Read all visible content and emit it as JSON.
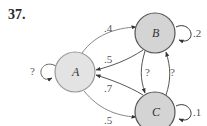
{
  "problem": {
    "number": "37."
  },
  "nodes": [
    {
      "id": "A",
      "label": "A",
      "cx": 75,
      "cy": 72,
      "r": 20,
      "fill": "#e3e3e3",
      "stroke": "#999999"
    },
    {
      "id": "B",
      "label": "B",
      "cx": 155,
      "cy": 33,
      "r": 20,
      "fill": "#d4d4d4",
      "stroke": "#555555"
    },
    {
      "id": "C",
      "label": "C",
      "cx": 155,
      "cy": 112,
      "r": 20,
      "fill": "#d4d4d4",
      "stroke": "#555555"
    }
  ],
  "edges": [
    {
      "from": "A",
      "to": "B",
      "label": ".4"
    },
    {
      "from": "B",
      "to": "A",
      "label": ".5"
    },
    {
      "from": "C",
      "to": "A",
      "label": ".7"
    },
    {
      "from": "A",
      "to": "C",
      "label": ".5"
    },
    {
      "from": "B",
      "to": "C",
      "label": "?"
    },
    {
      "from": "C",
      "to": "B",
      "label": "?"
    },
    {
      "from": "A",
      "to": "A",
      "label": "?"
    },
    {
      "from": "B",
      "to": "B",
      "label": ".2"
    },
    {
      "from": "C",
      "to": "C",
      "label": ".1"
    }
  ]
}
